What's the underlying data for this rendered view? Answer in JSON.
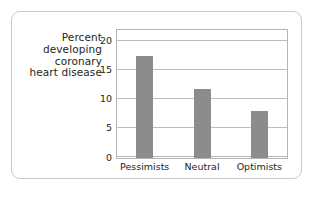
{
  "figure": {
    "card_border_color": "#c9c9c9",
    "background_color": "#ffffff"
  },
  "axis_title": {
    "lines": [
      "Percent",
      "developing",
      "coronary",
      "heart disease"
    ]
  },
  "chart_data": {
    "type": "bar",
    "title": "",
    "subtitle": "",
    "xlabel": "",
    "ylabel": "Percent developing coronary heart disease",
    "categories": [
      "Pessimists",
      "Neutral",
      "Optimists"
    ],
    "values": [
      17.5,
      11.8,
      8.0
    ],
    "series": [
      {
        "name": "Percent developing coronary heart disease",
        "values": [
          17.5,
          11.8,
          8.0
        ]
      }
    ],
    "ylim": [
      0,
      22
    ],
    "yticks": [
      0,
      5,
      10,
      15,
      20
    ],
    "ytick_labels": [
      "0",
      "5",
      "10",
      "15",
      "20"
    ],
    "grid": true,
    "grid_axis": "y",
    "legend": false,
    "legend_position": "none",
    "bar_color": "#8c8c8c",
    "gridline_color": "#bdbdbd",
    "plot_border_color": "#b4b4b4",
    "text_color": "#231f20"
  }
}
